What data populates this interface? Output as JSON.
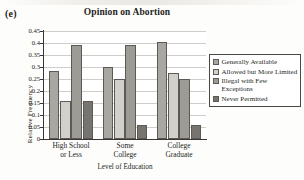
{
  "panel_letter": "(e)",
  "axis_title_x": "Level of Education",
  "axis_title_y": "Relative Frequency",
  "colors": {
    "series_generally_available": "#a9a7a2",
    "series_allowed_but_more_limited": "#d2d0cb",
    "series_illegal_with_few_exceptions": "#9d9b96",
    "series_never_permitted": "#77746f",
    "bar_outline": "#5d5a55",
    "gridline": "#cfcdc9",
    "axis": "#3a3634",
    "text": "#231f1c",
    "plot_background": "#ffffff",
    "page_background": "#fdfdfb"
  },
  "legend": {
    "position": "right",
    "entries": [
      {
        "label": "Generally Available",
        "color_key": "series_generally_available"
      },
      {
        "label": "Allowed but More Limited",
        "color_key": "series_allowed_but_more_limited"
      },
      {
        "label": "Illegal with Few Exceptions",
        "color_key": "series_illegal_with_few_exceptions"
      },
      {
        "label": "Never Permitted",
        "color_key": "series_never_permitted"
      }
    ]
  },
  "y_ticks": [
    "0",
    "0.05",
    "0.1",
    "0.15",
    "0.2",
    "0.25",
    "0.3",
    "0.35",
    "0.4",
    "0.45"
  ],
  "chart_data": {
    "type": "bar",
    "title": "Opinion on Abortion",
    "xlabel": "Level of Education",
    "ylabel": "Relative Frequency",
    "ylim": [
      0,
      0.45
    ],
    "ytick_step": 0.05,
    "grid": true,
    "legend_position": "right",
    "categories": [
      "High School or Less",
      "Some College",
      "College Graduate"
    ],
    "category_lines": [
      [
        "High School",
        "or Less"
      ],
      [
        "Some",
        "College"
      ],
      [
        "College",
        "Graduate"
      ]
    ],
    "series": [
      {
        "name": "Generally Available",
        "values": [
          0.283,
          0.298,
          0.405
        ]
      },
      {
        "name": "Allowed but More Limited",
        "values": [
          0.159,
          0.248,
          0.275
        ]
      },
      {
        "name": "Illegal with Few Exceptions",
        "values": [
          0.392,
          0.39,
          0.248
        ]
      },
      {
        "name": "Never Permitted",
        "values": [
          0.16,
          0.057,
          0.057
        ]
      }
    ]
  }
}
